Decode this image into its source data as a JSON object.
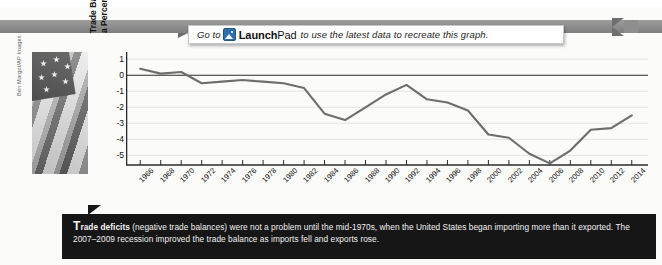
{
  "banner": {
    "prefix": "Go to",
    "icon": "launchpad-image-icon",
    "brand_bold": "Launch",
    "brand_thin": "Pad",
    "suffix": "to use the latest data to recreate this graph."
  },
  "photo": {
    "alt": "american-flag-photo",
    "credit": "Ben Margot/AP Images"
  },
  "caption": {
    "lead": "Trade deficits",
    "rest": " (negative trade balances) were not a problem until the mid-1970s, when the United States began importing more than it exported. The 2007–2009 recession improved the trade balance as imports fell and exports rose."
  },
  "chart_data": {
    "type": "line",
    "title": "",
    "xlabel": "",
    "ylabel": "Trade Balance as a Percent of GDP",
    "ylabel_line1": "Trade Balance as",
    "ylabel_line2": "a Percent of GDP",
    "ylim": [
      -5.6,
      1.2
    ],
    "yticks": [
      1,
      0,
      -1,
      -2,
      -3,
      -4,
      -5
    ],
    "ytick_labels": [
      "1",
      "0",
      "-1",
      "-2",
      "-3",
      "-4",
      "-5"
    ],
    "xlim": [
      1965,
      2015
    ],
    "xticks": [
      1966,
      1968,
      1970,
      1972,
      1974,
      1976,
      1978,
      1980,
      1982,
      1984,
      1986,
      1988,
      1990,
      1992,
      1994,
      1996,
      1998,
      2000,
      2002,
      2004,
      2006,
      2008,
      2010,
      2012,
      2014
    ],
    "xtick_labels": [
      "1966",
      "1968",
      "1970",
      "1972",
      "1974",
      "1976",
      "1978",
      "1980",
      "1982",
      "1984",
      "1986",
      "1988",
      "1990",
      "1992",
      "1994",
      "1996",
      "1998",
      "2000",
      "2002",
      "2004",
      "2006",
      "2008",
      "2010",
      "2012",
      "2014"
    ],
    "grid": "horizontal",
    "legend": "none",
    "zero_line": 0,
    "line_color": "#6d6d6d",
    "series": [
      {
        "name": "Trade balance as a percent of GDP",
        "x": [
          1966,
          1968,
          1970,
          1972,
          1974,
          1976,
          1978,
          1980,
          1982,
          1984,
          1986,
          1988,
          1990,
          1992,
          1994,
          1996,
          1998,
          2000,
          2002,
          2004,
          2006,
          2008,
          2010,
          2012,
          2014
        ],
        "values": [
          0.4,
          0.1,
          0.2,
          -0.5,
          -0.4,
          -0.3,
          -0.4,
          -0.5,
          -0.8,
          -2.4,
          -2.8,
          -2.0,
          -1.2,
          -0.6,
          -1.5,
          -1.7,
          -2.2,
          -3.7,
          -3.9,
          -4.9,
          -5.5,
          -4.7,
          -3.4,
          -3.3,
          -2.5
        ]
      }
    ]
  }
}
